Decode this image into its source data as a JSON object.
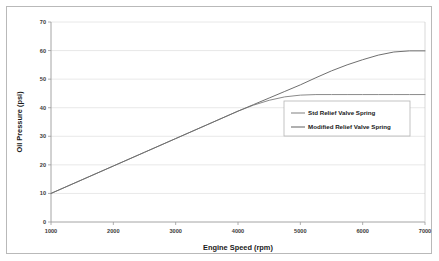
{
  "chart_data": {
    "type": "line",
    "title": "",
    "xlabel": "Engine Speed (rpm)",
    "ylabel": "Oil Pressure (psi)",
    "xlim": [
      1000,
      7000
    ],
    "ylim": [
      0,
      70
    ],
    "xticks": [
      1000,
      2000,
      3000,
      4000,
      5000,
      6000,
      7000
    ],
    "yticks": [
      0,
      10,
      20,
      30,
      40,
      50,
      60,
      70
    ],
    "xtick_labels": [
      "1000",
      "2000",
      "3000",
      "4000",
      "5000",
      "6000",
      "7000"
    ],
    "ytick_labels": [
      "0",
      "10",
      "20",
      "30",
      "40",
      "50",
      "60",
      "70"
    ],
    "grid": "horizontal",
    "legend_position": "center-right",
    "x": [
      1000,
      1500,
      2000,
      2500,
      3000,
      3500,
      4000,
      4250,
      4500,
      4750,
      5000,
      5250,
      5500,
      5750,
      6000,
      6250,
      6500,
      6750,
      7000
    ],
    "series": [
      {
        "name": "Std Relief Valve Spring",
        "color": "#8a8a8a",
        "values": [
          10.0,
          14.8,
          19.6,
          24.4,
          29.2,
          34.0,
          38.8,
          40.9,
          42.6,
          43.8,
          44.4,
          44.6,
          44.6,
          44.6,
          44.6,
          44.6,
          44.6,
          44.6,
          44.6
        ]
      },
      {
        "name": "Modified Relief Valve Spring",
        "color": "#6f6f6f",
        "values": [
          10.0,
          14.8,
          19.6,
          24.4,
          29.2,
          34.0,
          38.8,
          41.1,
          43.4,
          45.7,
          48.0,
          50.5,
          52.9,
          55.0,
          56.8,
          58.4,
          59.5,
          59.9,
          59.9
        ]
      }
    ]
  },
  "legend": {
    "entries": [
      {
        "label": "Std Relief Valve Spring",
        "color": "#8a8a8a"
      },
      {
        "label": "Modified Relief Valve Spring",
        "color": "#6f6f6f"
      }
    ]
  }
}
